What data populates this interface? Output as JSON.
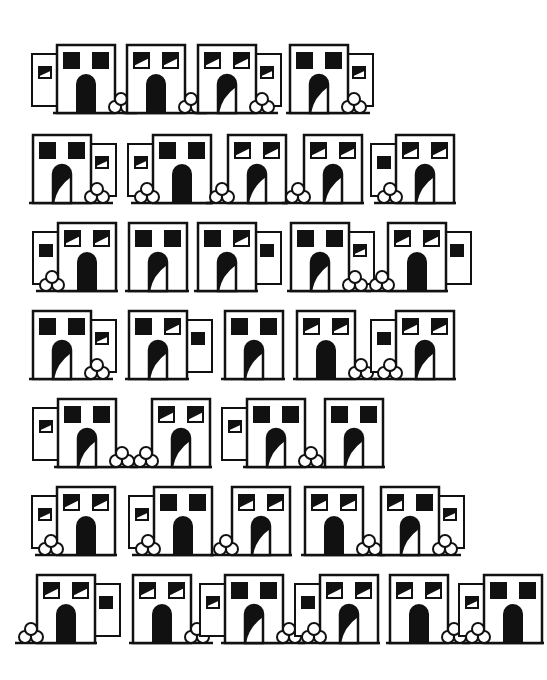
{
  "page": {
    "background": "#ffffff",
    "ink": "#111111"
  },
  "legend": {
    "annex_side": [
      "none",
      "left",
      "right"
    ],
    "window_style": [
      "solid",
      "half"
    ],
    "door_style": [
      "solid",
      "half"
    ],
    "bush_side": [
      "none",
      "left",
      "right"
    ]
  },
  "rows": [
    {
      "y": 45,
      "buildings": [
        {
          "x": 57,
          "annex": "left",
          "annex_window": "half",
          "windows": [
            "solid",
            "solid"
          ],
          "door": "solid",
          "bush": "right"
        },
        {
          "x": 127,
          "annex": "none",
          "annex_window": "none",
          "windows": [
            "half",
            "half"
          ],
          "door": "solid",
          "bush": "right"
        },
        {
          "x": 198,
          "annex": "right",
          "annex_window": "half",
          "windows": [
            "half",
            "half"
          ],
          "door": "half",
          "bush": "right"
        },
        {
          "x": 290,
          "annex": "right",
          "annex_window": "half",
          "windows": [
            "solid",
            "solid"
          ],
          "door": "half",
          "bush": "right"
        }
      ]
    },
    {
      "y": 135,
      "buildings": [
        {
          "x": 33,
          "annex": "right",
          "annex_window": "half",
          "windows": [
            "solid",
            "solid"
          ],
          "door": "half",
          "bush": "right"
        },
        {
          "x": 153,
          "annex": "left",
          "annex_window": "half",
          "windows": [
            "solid",
            "solid"
          ],
          "door": "solid",
          "bush": "left"
        },
        {
          "x": 228,
          "annex": "none",
          "annex_window": "none",
          "windows": [
            "half",
            "half"
          ],
          "door": "half",
          "bush": "left"
        },
        {
          "x": 304,
          "annex": "none",
          "annex_window": "none",
          "windows": [
            "half",
            "half"
          ],
          "door": "half",
          "bush": "left"
        },
        {
          "x": 396,
          "annex": "left",
          "annex_window": "solid",
          "windows": [
            "half",
            "half"
          ],
          "door": "half",
          "bush": "left"
        }
      ]
    },
    {
      "y": 223,
      "buildings": [
        {
          "x": 58,
          "annex": "left",
          "annex_window": "solid",
          "windows": [
            "half",
            "half"
          ],
          "door": "solid",
          "bush": "left"
        },
        {
          "x": 129,
          "annex": "none",
          "annex_window": "none",
          "windows": [
            "solid",
            "solid"
          ],
          "door": "half",
          "bush": "none"
        },
        {
          "x": 198,
          "annex": "right",
          "annex_window": "solid",
          "windows": [
            "solid",
            "half"
          ],
          "door": "half",
          "bush": "none"
        },
        {
          "x": 291,
          "annex": "right",
          "annex_window": "half",
          "windows": [
            "solid",
            "solid"
          ],
          "door": "half",
          "bush": "right"
        },
        {
          "x": 388,
          "annex": "right",
          "annex_window": "solid",
          "windows": [
            "half",
            "half"
          ],
          "door": "solid",
          "bush": "left"
        }
      ]
    },
    {
      "y": 311,
      "buildings": [
        {
          "x": 33,
          "annex": "right",
          "annex_window": "half",
          "windows": [
            "solid",
            "solid"
          ],
          "door": "half",
          "bush": "right"
        },
        {
          "x": 129,
          "annex": "right",
          "annex_window": "solid",
          "windows": [
            "solid",
            "half"
          ],
          "door": "half",
          "bush": "none"
        },
        {
          "x": 225,
          "annex": "none",
          "annex_window": "none",
          "windows": [
            "solid",
            "solid"
          ],
          "door": "half",
          "bush": "none"
        },
        {
          "x": 297,
          "annex": "none",
          "annex_window": "none",
          "windows": [
            "half",
            "half"
          ],
          "door": "solid",
          "bush": "right"
        },
        {
          "x": 396,
          "annex": "left",
          "annex_window": "solid",
          "windows": [
            "half",
            "half"
          ],
          "door": "half",
          "bush": "left"
        }
      ]
    },
    {
      "y": 399,
      "buildings": [
        {
          "x": 58,
          "annex": "left",
          "annex_window": "half",
          "windows": [
            "solid",
            "solid"
          ],
          "door": "half",
          "bush": "right"
        },
        {
          "x": 152,
          "annex": "none",
          "annex_window": "none",
          "windows": [
            "half",
            "half"
          ],
          "door": "half",
          "bush": "left"
        },
        {
          "x": 247,
          "annex": "left",
          "annex_window": "half",
          "windows": [
            "solid",
            "solid"
          ],
          "door": "half",
          "bush": "right"
        },
        {
          "x": 325,
          "annex": "none",
          "annex_window": "none",
          "windows": [
            "solid",
            "solid"
          ],
          "door": "half",
          "bush": "none"
        }
      ]
    },
    {
      "y": 487,
      "buildings": [
        {
          "x": 57,
          "annex": "left",
          "annex_window": "half",
          "windows": [
            "half",
            "half"
          ],
          "door": "solid",
          "bush": "left"
        },
        {
          "x": 154,
          "annex": "left",
          "annex_window": "half",
          "windows": [
            "solid",
            "solid"
          ],
          "door": "solid",
          "bush": "left"
        },
        {
          "x": 232,
          "annex": "none",
          "annex_window": "none",
          "windows": [
            "half",
            "half"
          ],
          "door": "half",
          "bush": "left"
        },
        {
          "x": 305,
          "annex": "none",
          "annex_window": "none",
          "windows": [
            "half",
            "half"
          ],
          "door": "solid",
          "bush": "right"
        },
        {
          "x": 381,
          "annex": "right",
          "annex_window": "half",
          "windows": [
            "half",
            "solid"
          ],
          "door": "half",
          "bush": "right"
        }
      ]
    },
    {
      "y": 575,
      "buildings": [
        {
          "x": 37,
          "annex": "right",
          "annex_window": "solid",
          "windows": [
            "half",
            "half"
          ],
          "door": "solid",
          "bush": "left"
        },
        {
          "x": 133,
          "annex": "none",
          "annex_window": "none",
          "windows": [
            "half",
            "half"
          ],
          "door": "solid",
          "bush": "right"
        },
        {
          "x": 225,
          "annex": "left",
          "annex_window": "half",
          "windows": [
            "solid",
            "solid"
          ],
          "door": "half",
          "bush": "right"
        },
        {
          "x": 320,
          "annex": "left",
          "annex_window": "solid",
          "windows": [
            "half",
            "half"
          ],
          "door": "half",
          "bush": "left"
        },
        {
          "x": 390,
          "annex": "none",
          "annex_window": "none",
          "windows": [
            "half",
            "half"
          ],
          "door": "solid",
          "bush": "right"
        },
        {
          "x": 484,
          "annex": "left",
          "annex_window": "half",
          "windows": [
            "solid",
            "solid"
          ],
          "door": "solid",
          "bush": "left"
        }
      ]
    }
  ]
}
